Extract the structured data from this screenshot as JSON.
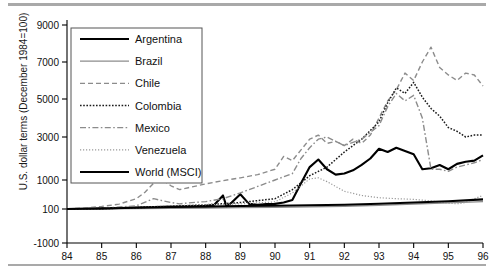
{
  "chart_data": {
    "type": "line",
    "title": "",
    "xlabel": "",
    "ylabel": "U.S. dollar terms (December 1984=100)",
    "xlim": [
      84,
      96
    ],
    "ylim": [
      -1000,
      9000
    ],
    "grid": false,
    "legend_position": "top-left-inside",
    "x_tick_labels": [
      "84",
      "85",
      "86",
      "87",
      "88",
      "89",
      "90",
      "91",
      "92",
      "93",
      "94",
      "95",
      "96"
    ],
    "x_ticks": [
      84,
      85,
      86,
      87,
      88,
      89,
      90,
      91,
      92,
      93,
      94,
      95,
      96
    ],
    "y_tick_labels": [
      "9000",
      "7000",
      "5000",
      "3000",
      "1000",
      "100",
      "-1000"
    ],
    "y_ticks": [
      9000,
      7000,
      5000,
      3000,
      1000,
      100,
      -1000
    ],
    "series": [
      {
        "name": "Argentina",
        "style": "solid-thick-black",
        "color": "#000000",
        "x": [
          84.0,
          84.5,
          85.0,
          85.5,
          86.0,
          86.5,
          87.0,
          87.5,
          88.0,
          88.25,
          88.5,
          88.6,
          88.75,
          89.0,
          89.25,
          89.5,
          89.75,
          90.0,
          90.25,
          90.5,
          90.75,
          91.0,
          91.25,
          91.5,
          91.75,
          92.0,
          92.25,
          92.5,
          92.75,
          93.0,
          93.25,
          93.5,
          93.75,
          94.0,
          94.25,
          94.5,
          94.75,
          95.0,
          95.25,
          95.5,
          95.75,
          96.0
        ],
        "values": [
          100,
          110,
          120,
          130,
          145,
          160,
          175,
          185,
          200,
          230,
          520,
          180,
          300,
          560,
          260,
          230,
          250,
          260,
          300,
          380,
          900,
          1600,
          1950,
          1500,
          1250,
          1300,
          1450,
          1700,
          2000,
          2450,
          2300,
          2500,
          2350,
          2200,
          1500,
          1550,
          1700,
          1500,
          1750,
          1850,
          1900,
          2150
        ]
      },
      {
        "name": "Brazil",
        "style": "solid-gray",
        "color": "#8c8c8c",
        "x": [
          84.0,
          85.0,
          86.0,
          87.0,
          88.0,
          89.0,
          90.0,
          91.0,
          92.0,
          93.0,
          94.0,
          95.0,
          96.0
        ],
        "values": [
          100,
          105,
          115,
          120,
          130,
          140,
          150,
          165,
          185,
          215,
          255,
          290,
          330
        ]
      },
      {
        "name": "Chile",
        "style": "dashed-gray",
        "color": "#8c8c8c",
        "x": [
          84.0,
          84.5,
          85.0,
          85.5,
          86.0,
          86.25,
          86.5,
          86.75,
          87.0,
          87.25,
          87.5,
          87.75,
          88.0,
          88.5,
          89.0,
          89.5,
          90.0,
          90.25,
          90.5,
          90.75,
          91.0,
          91.25,
          91.5,
          91.75,
          92.0,
          92.25,
          92.5,
          92.75,
          93.0,
          93.25,
          93.5,
          93.75,
          94.0,
          94.25,
          94.5,
          94.75,
          95.0,
          95.25,
          95.5,
          95.75,
          96.0
        ],
        "values": [
          100,
          130,
          180,
          250,
          420,
          620,
          900,
          1020,
          820,
          700,
          760,
          820,
          880,
          980,
          1100,
          1250,
          1500,
          2100,
          1900,
          2400,
          2900,
          3100,
          2700,
          2800,
          2600,
          2900,
          2700,
          3100,
          4000,
          4900,
          5500,
          6400,
          6000,
          7000,
          7800,
          6700,
          6300,
          6000,
          6400,
          6300,
          5700
        ]
      },
      {
        "name": "Colombia",
        "style": "dotted-black",
        "color": "#1a1a1a",
        "x": [
          84.0,
          85.0,
          86.0,
          87.0,
          88.0,
          89.0,
          90.0,
          90.5,
          91.0,
          91.5,
          92.0,
          92.5,
          93.0,
          93.25,
          93.5,
          93.75,
          94.0,
          94.25,
          94.5,
          94.75,
          95.0,
          95.25,
          95.5,
          95.75,
          96.0
        ],
        "values": [
          100,
          110,
          140,
          180,
          230,
          300,
          420,
          700,
          1200,
          1600,
          2300,
          2900,
          3800,
          4800,
          5600,
          5300,
          5900,
          5100,
          4500,
          4100,
          3500,
          3300,
          3000,
          3100,
          3100
        ]
      },
      {
        "name": "Mexico",
        "style": "dashdot-gray",
        "color": "#8c8c8c",
        "x": [
          84.0,
          85.0,
          86.0,
          86.5,
          87.0,
          87.25,
          87.5,
          88.0,
          88.5,
          89.0,
          89.5,
          90.0,
          90.5,
          90.75,
          91.0,
          91.25,
          91.5,
          91.75,
          92.0,
          92.5,
          93.0,
          93.25,
          93.5,
          93.75,
          94.0,
          94.25,
          94.5,
          94.75,
          95.0,
          95.25,
          95.5,
          95.75,
          96.0
        ],
        "values": [
          100,
          120,
          200,
          420,
          300,
          260,
          290,
          330,
          420,
          600,
          800,
          1000,
          1300,
          2000,
          2500,
          2900,
          3000,
          2800,
          2600,
          2900,
          3600,
          4600,
          5300,
          4900,
          5200,
          4000,
          1500,
          1500,
          1400,
          1600,
          1700,
          1800,
          1950
        ]
      },
      {
        "name": "Venezuela",
        "style": "finedot-gray",
        "color": "#999999",
        "x": [
          84.0,
          85.0,
          86.0,
          87.0,
          88.0,
          89.0,
          90.0,
          90.5,
          91.0,
          91.25,
          91.5,
          91.75,
          92.0,
          92.5,
          93.0,
          93.5,
          94.0,
          94.5,
          95.0,
          95.25,
          95.5,
          95.75,
          96.0
        ],
        "values": [
          100,
          120,
          150,
          200,
          230,
          260,
          320,
          600,
          1050,
          1100,
          950,
          800,
          650,
          520,
          450,
          420,
          400,
          350,
          280,
          260,
          300,
          420,
          520
        ]
      },
      {
        "name": "World (MSCI)",
        "style": "solid-thick-black",
        "color": "#000000",
        "x": [
          84.0,
          85.0,
          86.0,
          87.0,
          88.0,
          89.0,
          90.0,
          91.0,
          92.0,
          93.0,
          94.0,
          95.0,
          96.0
        ],
        "values": [
          100,
          115,
          140,
          160,
          175,
          195,
          200,
          215,
          230,
          265,
          300,
          340,
          400
        ]
      }
    ]
  },
  "legend": {
    "entries": [
      {
        "label": "Argentina",
        "style": "solid-thick-black"
      },
      {
        "label": "Brazil",
        "style": "solid-gray"
      },
      {
        "label": "Chile",
        "style": "dashed-gray"
      },
      {
        "label": "Colombia",
        "style": "dotted-black"
      },
      {
        "label": "Mexico",
        "style": "dashdot-gray"
      },
      {
        "label": "Venezuela",
        "style": "finedot-gray"
      },
      {
        "label": "World (MSCI)",
        "style": "solid-thick-black"
      }
    ]
  },
  "colors": {
    "black": "#000000",
    "gray": "#8c8c8c",
    "light_gray": "#999999",
    "rule": "#a9a9a9",
    "background": "#ffffff"
  }
}
